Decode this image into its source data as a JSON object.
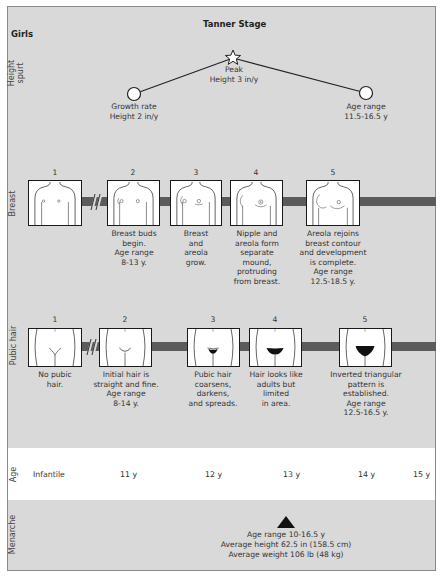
{
  "header": {
    "title": "Tanner Stage",
    "group": "Girls"
  },
  "rows": {
    "height_spurt": "Height spurt",
    "breast": "Breast",
    "pubic_hair": "Pubic hair",
    "age": "Age",
    "menarche": "Menarche"
  },
  "height_spurt": {
    "start": {
      "line1": "Growth rate",
      "line2": "Height 2 in/y"
    },
    "peak": {
      "line1": "Peak",
      "line2": "Height 3 in/y"
    },
    "end": {
      "line1": "Age range",
      "line2": "11.5-16.5 y"
    }
  },
  "breast": {
    "stages": [
      {
        "number": "1",
        "caption": []
      },
      {
        "number": "2",
        "caption": [
          "Breast buds",
          "begin.",
          "Age range",
          "8-13 y."
        ]
      },
      {
        "number": "3",
        "caption": [
          "Breast",
          "and",
          "areola",
          "grow."
        ]
      },
      {
        "number": "4",
        "caption": [
          "Nipple and",
          "areola form",
          "separate",
          "mound,",
          "protruding",
          "from breast."
        ]
      },
      {
        "number": "5",
        "caption": [
          "Areola rejoins",
          "breast contour",
          "and development",
          "is complete.",
          "Age range",
          "12.5-18.5 y."
        ]
      }
    ]
  },
  "pubic_hair": {
    "stages": [
      {
        "number": "1",
        "caption": [
          "No pubic",
          "hair."
        ]
      },
      {
        "number": "2",
        "caption": [
          "Initial hair is",
          "straight and fine.",
          "Age range",
          "8-14 y."
        ]
      },
      {
        "number": "3",
        "caption": [
          "Pubic hair",
          "coarsens,",
          "darkens,",
          "and spreads."
        ]
      },
      {
        "number": "4",
        "caption": [
          "Hair looks like",
          "adults but",
          "limited",
          "in area."
        ]
      },
      {
        "number": "5",
        "caption": [
          "Inverted triangular",
          "pattern is",
          "established.",
          "Age range",
          "12.5-16.5 y."
        ]
      }
    ]
  },
  "age": {
    "ticks": [
      "Infantile",
      "11 y",
      "12 y",
      "13 y",
      "14 y",
      "15 y"
    ]
  },
  "menarche": {
    "marker_icon": "triangle-up-icon",
    "lines": [
      "Age range 10-16.5 y",
      "Average height 62.5 in (158.5 cm)",
      "Average weight 106 lb (48 kg)"
    ]
  },
  "colors": {
    "panel": "#d9d9d9",
    "band": "#5b5b5b",
    "age_row": "#ffffff",
    "line": "#222222"
  }
}
